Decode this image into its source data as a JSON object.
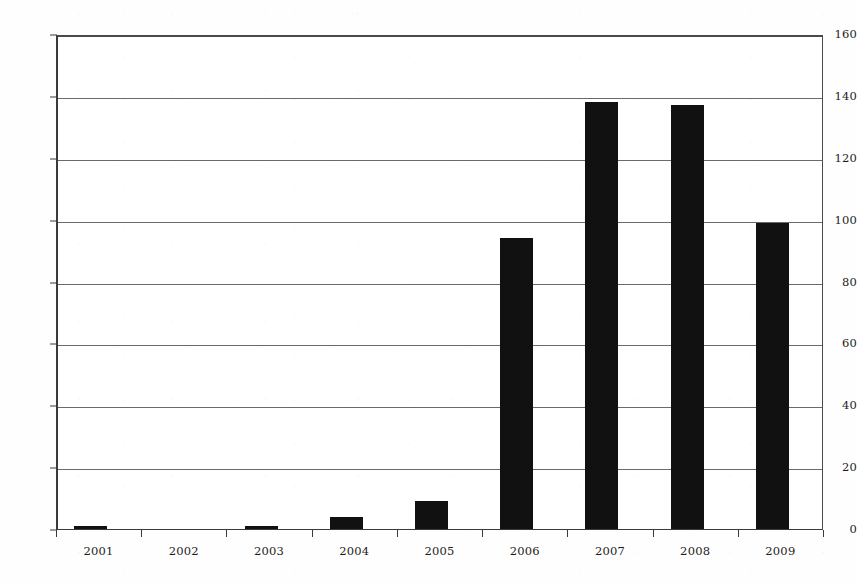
{
  "chart_data": {
    "type": "bar",
    "title": "",
    "subtitle": "",
    "xlabel": "",
    "ylabel": "",
    "categories": [
      "2001",
      "2002",
      "2003",
      "2004",
      "2005",
      "2006",
      "2007",
      "2008",
      "2009"
    ],
    "values": [
      1,
      0,
      1,
      4,
      9,
      94,
      138,
      137,
      99
    ],
    "series": [
      {
        "name": "",
        "values": [
          1,
          0,
          1,
          4,
          9,
          94,
          138,
          137,
          99
        ],
        "color": "#111111"
      }
    ],
    "ylim": [
      0,
      160
    ],
    "ytick_step": 20,
    "yticks": [
      "160",
      "140",
      "120",
      "100",
      "80",
      "60",
      "40",
      "20",
      "0"
    ],
    "ytick_values": [
      160,
      140,
      120,
      100,
      80,
      60,
      40,
      20,
      0
    ],
    "xticks": [
      "2001",
      "2002",
      "2003",
      "2004",
      "2005",
      "2006",
      "2007",
      "2008",
      "2009"
    ],
    "grid": true,
    "grid_axis": "y",
    "legend": false,
    "legend_entries": [],
    "annotations": [],
    "bar_color": "#111111",
    "grid_color": "#6a6a6a",
    "axis_color": "#3a3a3a",
    "background_color": "#ffffff"
  }
}
